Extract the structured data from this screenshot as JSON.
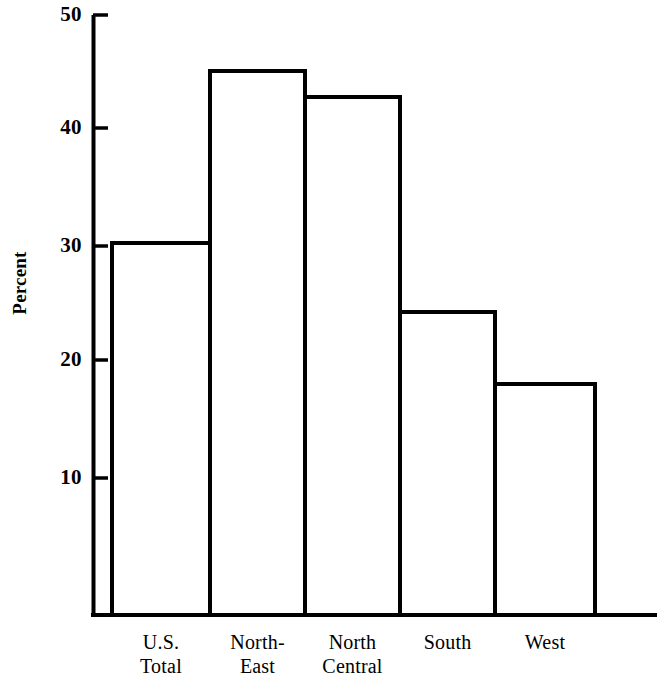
{
  "chart_data": {
    "type": "bar",
    "title": "",
    "xlabel": "",
    "ylabel": "Percent",
    "categories": [
      "U.S.\nTotal",
      "North-\nEast",
      "North\nCentral",
      "South",
      "West"
    ],
    "values": [
      31.0,
      45.5,
      43.3,
      25.3,
      19.2
    ],
    "ylim": [
      0,
      50
    ],
    "yticks": [
      10,
      20,
      30,
      40,
      50
    ],
    "ytick_labels": [
      "10",
      "20",
      "30",
      "40",
      "50"
    ],
    "grid": false,
    "legend": "none",
    "bar_fill": "#ffffff",
    "bar_edge": "#000000",
    "axis_color": "#000000"
  },
  "axis": {
    "y_label": "Percent",
    "ticks": [
      {
        "value": "50",
        "pos": 15
      },
      {
        "value": "40",
        "pos": 128
      },
      {
        "value": "30",
        "pos": 246
      },
      {
        "value": "20",
        "pos": 360
      },
      {
        "value": "10",
        "pos": 478
      }
    ]
  },
  "bars": [
    {
      "label": "U.S.\nTotal",
      "value": 31.0,
      "x0": 112,
      "x1": 210,
      "top": 243
    },
    {
      "label": "North-\nEast",
      "value": 45.5,
      "x0": 210,
      "x1": 305,
      "top": 71
    },
    {
      "label": "North\nCentral",
      "value": 43.3,
      "x0": 305,
      "x1": 400,
      "top": 97
    },
    {
      "label": "South",
      "value": 25.3,
      "x0": 400,
      "x1": 495,
      "top": 312
    },
    {
      "label": "West",
      "value": 19.2,
      "x0": 495,
      "x1": 595,
      "top": 384
    }
  ]
}
